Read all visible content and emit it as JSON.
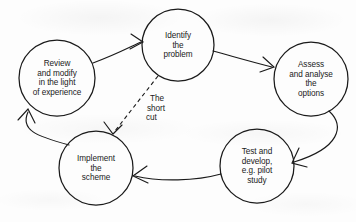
{
  "diagram": {
    "stroke_color": "#1a1a1a",
    "background_color": "#fdfdfd",
    "nodes": [
      {
        "id": "identify",
        "name": "identify-the-problem",
        "lines": [
          "Identify",
          "the",
          "problem"
        ],
        "cx": 178,
        "cy": 45,
        "r": 36
      },
      {
        "id": "assess",
        "name": "assess-and-analyse-the-options",
        "lines": [
          "Assess",
          "and analyse",
          "the",
          "options"
        ],
        "cx": 311,
        "cy": 79,
        "r": 37
      },
      {
        "id": "test",
        "name": "test-and-develop",
        "lines": [
          "Test and",
          "develop,",
          "e.g. pilot",
          "study"
        ],
        "cx": 257,
        "cy": 166,
        "r": 37
      },
      {
        "id": "implement",
        "name": "implement-the-scheme",
        "lines": [
          "Implement",
          "the",
          "scheme"
        ],
        "cx": 96,
        "cy": 168,
        "r": 37
      },
      {
        "id": "review",
        "name": "review-and-modify",
        "lines": [
          "Review",
          "and modify",
          "in the light",
          "of experience"
        ],
        "cx": 57,
        "cy": 78,
        "r": 38
      }
    ],
    "edges": [
      {
        "id": "review-to-identify",
        "name": "arrow-review-to-identify",
        "from": "review",
        "to": "identify",
        "style": "solid"
      },
      {
        "id": "identify-to-assess",
        "name": "arrow-identify-to-assess",
        "from": "identify",
        "to": "assess",
        "style": "solid"
      },
      {
        "id": "assess-to-test",
        "name": "arrow-assess-to-test",
        "from": "assess",
        "to": "test",
        "style": "solid"
      },
      {
        "id": "test-to-implement",
        "name": "arrow-test-to-implement",
        "from": "test",
        "to": "implement",
        "style": "solid"
      },
      {
        "id": "implement-to-review",
        "name": "arrow-implement-to-review",
        "from": "implement",
        "to": "review",
        "style": "solid"
      },
      {
        "id": "identify-to-implement",
        "name": "arrow-shortcut-identify-to-implement",
        "from": "identify",
        "to": "implement",
        "style": "dashed"
      }
    ],
    "annotations": [
      {
        "id": "shortcut",
        "name": "shortcut-label",
        "lines": [
          "The",
          "short",
          "cut"
        ],
        "x": 146,
        "y": 94
      }
    ]
  }
}
